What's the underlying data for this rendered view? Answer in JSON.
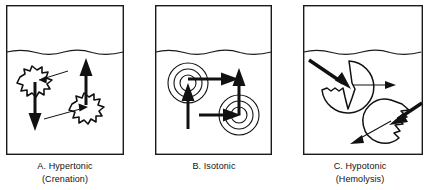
{
  "figure": {
    "panels": [
      {
        "id": "panel-a",
        "letter": "A.",
        "caption_line_1": "A.  Hypertonic",
        "caption_line_2": "(Crenation)",
        "cell_shape": "crenated-spiky",
        "cells": 2,
        "water_in_arrow": "thin",
        "water_out_arrow": "thick",
        "solution_line": "wavy-waterline"
      },
      {
        "id": "panel-b",
        "letter": "B.",
        "caption_line_1": "B.  Isotonic",
        "caption_line_2": "",
        "cell_shape": "concentric-circles",
        "cells": 2,
        "water_in_arrow": "thick",
        "water_out_arrow": "thick",
        "solution_line": "wavy-waterline"
      },
      {
        "id": "panel-c",
        "letter": "C.",
        "caption_line_1": "C.  Hypotonic",
        "caption_line_2": "(Hemolysis)",
        "cell_shape": "swollen-bursting",
        "cells": 2,
        "water_in_arrow": "thick",
        "water_out_arrow": "thin",
        "solution_line": "wavy-waterline"
      }
    ]
  },
  "colors": {
    "ink": "#111111",
    "background": "#ffffff",
    "border": "#1a1a1a"
  }
}
